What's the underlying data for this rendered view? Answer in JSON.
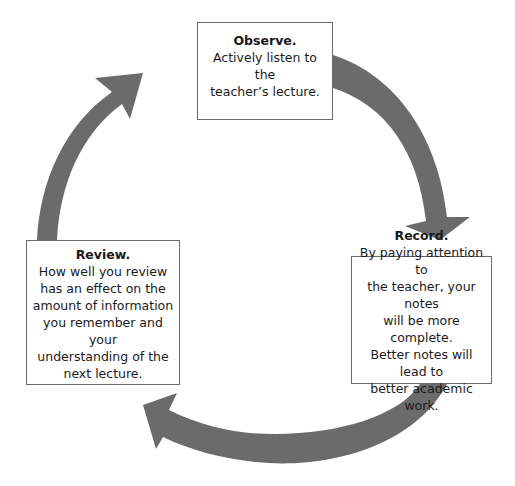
{
  "diagram": {
    "type": "cycle",
    "arrow_color": "#6b6b6b",
    "steps": [
      {
        "id": "observe",
        "title": "Observe.",
        "lines": [
          "Actively listen to the",
          "teacher’s lecture."
        ]
      },
      {
        "id": "record",
        "title": "Record.",
        "lines": [
          "By paying attention to",
          "the teacher, your notes",
          "will be more complete.",
          "Better notes will lead to",
          "better academic work."
        ]
      },
      {
        "id": "review",
        "title": "Review.",
        "lines": [
          "How well you review",
          "has an effect on the",
          "amount of information",
          "you remember and your",
          "understanding of the",
          "next lecture."
        ]
      }
    ],
    "flow": [
      "observe → record",
      "record → review",
      "review → observe"
    ]
  }
}
